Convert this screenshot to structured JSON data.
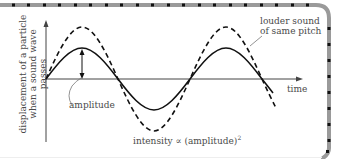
{
  "diagram": {
    "y_axis_label_line1": "displacement of a particle",
    "y_axis_label_line2": "when a sound wave passes",
    "x_axis_label": "time",
    "amplitude_label": "amplitude",
    "louder_label_line1": "louder sound",
    "louder_label_line2": "of same pitch",
    "intensity_label": "intensity ∝ (amplitude)",
    "intensity_exponent": "2",
    "colors": {
      "curve": "#111111",
      "axis": "#444444",
      "text": "#4a4a4a",
      "border_band": "#9a9a9a",
      "border_dot": "#111111",
      "background": "#ffffff"
    },
    "curves": [
      {
        "name": "original sound",
        "style": "solid",
        "relative_amplitude": 1.0
      },
      {
        "name": "louder sound of same pitch",
        "style": "dashed",
        "relative_amplitude": 1.7
      }
    ]
  }
}
